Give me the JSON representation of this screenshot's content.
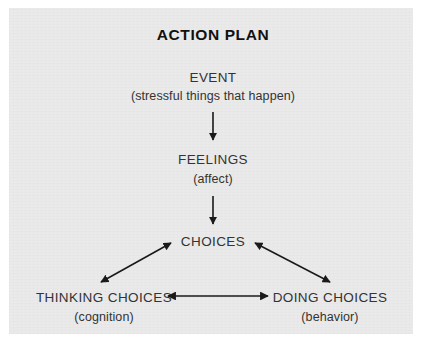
{
  "title": "ACTION PLAN",
  "theme": {
    "page_background": "#ffffff",
    "panel_background": "#eaeaea",
    "text_color": "#333333",
    "title_color": "#111111",
    "arrow_color": "#1a1a1a"
  },
  "diagram": {
    "type": "flowchart",
    "nodes": [
      {
        "id": "event",
        "label": "EVENT",
        "sublabel": "(stressful things that happen)"
      },
      {
        "id": "feelings",
        "label": "FEELINGS",
        "sublabel": "(affect)"
      },
      {
        "id": "choices",
        "label": "CHOICES",
        "sublabel": ""
      },
      {
        "id": "thinking",
        "label": "THINKING CHOICES",
        "sublabel": "(cognition)"
      },
      {
        "id": "doing",
        "label": "DOING CHOICES",
        "sublabel": "(behavior)"
      }
    ],
    "edges": [
      {
        "from": "event",
        "to": "feelings",
        "style": "single-arrow",
        "direction": "down"
      },
      {
        "from": "feelings",
        "to": "choices",
        "style": "single-arrow",
        "direction": "down"
      },
      {
        "from": "choices",
        "to": "thinking",
        "style": "double-arrow",
        "direction": "diagonal-down-left"
      },
      {
        "from": "choices",
        "to": "doing",
        "style": "double-arrow",
        "direction": "diagonal-down-right"
      },
      {
        "from": "thinking",
        "to": "doing",
        "style": "double-arrow",
        "direction": "horizontal"
      }
    ]
  }
}
